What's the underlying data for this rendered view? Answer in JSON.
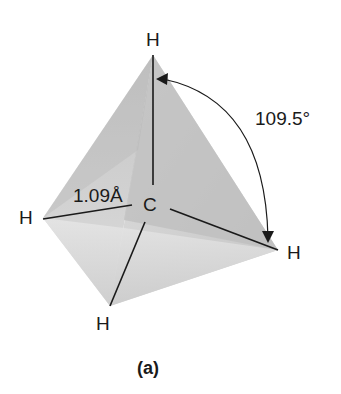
{
  "diagram": {
    "atoms": {
      "top": "H",
      "left": "H",
      "right": "H",
      "bottom": "H",
      "center": "C"
    },
    "bond_length": "1.09Å",
    "bond_angle": "109.5°",
    "caption": "(a)",
    "colors": {
      "face_light": "#e2e2e2",
      "face_mid": "#cfcfcf",
      "face_dark": "#b9b9b9",
      "line": "#1a1a1a"
    }
  }
}
